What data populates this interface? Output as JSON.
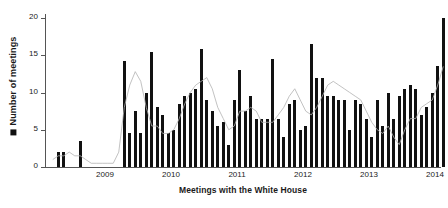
{
  "chart_data": {
    "type": "bar",
    "title": "",
    "subtitle": "",
    "xlabel": "Meetings with the White House",
    "ylabel": "Number of meetings",
    "legend": {
      "position": "y-axis-label",
      "entries": [
        {
          "name": "Number of meetings",
          "marker": "filled-square",
          "color": "#111111"
        },
        {
          "name": "trend line",
          "marker": "line",
          "color": "#b3b3b3"
        }
      ]
    },
    "grid": false,
    "ylim": [
      0,
      20
    ],
    "yticks": [
      0,
      5,
      10,
      15,
      20
    ],
    "ytick_labels": [
      "0",
      "5",
      "10",
      "15",
      "20"
    ],
    "xticks": [
      2009,
      2010,
      2011,
      2012,
      2013,
      2014
    ],
    "xtick_labels": [
      "2009",
      "2010",
      "2011",
      "2012",
      "2013",
      "2014"
    ],
    "x_unit": "month",
    "x_start": "2008-09",
    "n_bars": 72,
    "categories": [
      "2008-09",
      "2008-10",
      "2008-11",
      "2008-12",
      "2009-01",
      "2009-02",
      "2009-03",
      "2009-04",
      "2009-05",
      "2009-06",
      "2009-07",
      "2009-08",
      "2009-09",
      "2009-10",
      "2009-11",
      "2009-12",
      "2010-01",
      "2010-02",
      "2010-03",
      "2010-04",
      "2010-05",
      "2010-06",
      "2010-07",
      "2010-08",
      "2010-09",
      "2010-10",
      "2010-11",
      "2010-12",
      "2011-01",
      "2011-02",
      "2011-03",
      "2011-04",
      "2011-05",
      "2011-06",
      "2011-07",
      "2011-08",
      "2011-09",
      "2011-10",
      "2011-11",
      "2011-12",
      "2012-01",
      "2012-02",
      "2012-03",
      "2012-04",
      "2012-05",
      "2012-06",
      "2012-07",
      "2012-08",
      "2012-09",
      "2012-10",
      "2012-11",
      "2012-12",
      "2013-01",
      "2013-02",
      "2013-03",
      "2013-04",
      "2013-05",
      "2013-06",
      "2013-07",
      "2013-08",
      "2013-09",
      "2013-10",
      "2013-11",
      "2013-12",
      "2014-01",
      "2014-02",
      "2014-03",
      "2014-04",
      "2014-05",
      "2014-06",
      "2014-07",
      "2014-08"
    ],
    "series": [
      {
        "name": "Number of meetings",
        "type": "bar",
        "color": "#111111",
        "values": [
          0,
          2,
          2,
          0,
          0,
          3.5,
          0,
          0,
          0,
          0,
          0,
          0,
          0,
          14.2,
          4.5,
          7.5,
          4.5,
          10,
          15.5,
          8,
          7,
          4.5,
          5,
          8.5,
          9.5,
          10,
          10.5,
          15.8,
          9,
          7.5,
          5.5,
          6,
          3,
          9,
          13,
          7.5,
          9.5,
          6.5,
          6.5,
          6.5,
          14.5,
          6.5,
          4,
          8.5,
          9,
          5,
          5.5,
          16.5,
          12,
          12,
          9.5,
          9.5,
          9,
          9,
          5,
          9,
          8.5,
          6.5,
          4,
          9,
          5.5,
          10,
          6.5,
          9.5,
          10.5,
          11,
          10.5,
          7,
          8,
          10,
          13.5,
          20
        ]
      },
      {
        "name": "trend line",
        "type": "line",
        "color": "#b3b3b3",
        "values": [
          1,
          1.5,
          1.5,
          2,
          1.5,
          1.5,
          1,
          0.5,
          0.5,
          0.5,
          0.5,
          0.5,
          2,
          8,
          11,
          12.8,
          11.5,
          8,
          5.5,
          5.5,
          4.5,
          4.5,
          5,
          6.5,
          8.5,
          10,
          11,
          11.5,
          12,
          10.5,
          8,
          6.5,
          5,
          5.5,
          7.5,
          7.5,
          8,
          7.5,
          6,
          6,
          6,
          7,
          8,
          9.5,
          10.5,
          9,
          7.5,
          7,
          8,
          9.5,
          11,
          11.5,
          11,
          10.5,
          10,
          9.5,
          9,
          7.5,
          6,
          5,
          4.5,
          5.5,
          4,
          3,
          5,
          6.5,
          6.5,
          8,
          8.5,
          9,
          11,
          13.5
        ]
      }
    ]
  },
  "axis": {
    "y_label_text": "Number of meetings",
    "x_title_text": "Meetings with the White House"
  }
}
